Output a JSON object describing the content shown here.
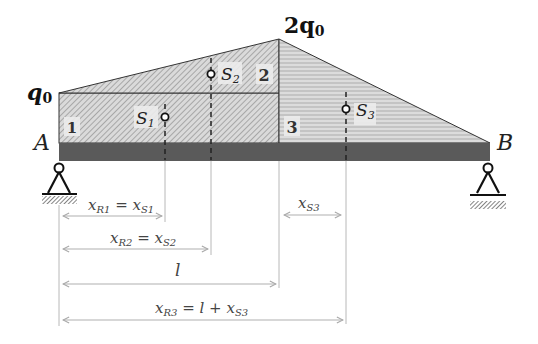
{
  "diagram": {
    "type": "beam-load-diagram",
    "colors": {
      "beam": "#5a5a5a",
      "region_hatch_bg": "#d8d8d8",
      "region_hatch_line": "#8a8a8a",
      "region3_bg": "#c8c8c8",
      "region3_line": "#efefef",
      "outline": "#333333",
      "dim_line": "#b0b0b0",
      "text": "#222222"
    },
    "load_labels": {
      "left": "q",
      "left_sub": "0",
      "peak_coef": "2q",
      "peak_sub": "0"
    },
    "supports": {
      "left": {
        "label": "A",
        "type": "pinned"
      },
      "right": {
        "label": "B",
        "type": "pinned"
      }
    },
    "regions": [
      {
        "number": "1",
        "shape": "rectangle",
        "pattern": "diagonal-hatch"
      },
      {
        "number": "2",
        "shape": "triangle",
        "pattern": "diagonal-hatch"
      },
      {
        "number": "3",
        "shape": "triangle",
        "pattern": "horizontal-lines"
      }
    ],
    "centroids": [
      {
        "label": "S",
        "sub": "1"
      },
      {
        "label": "S",
        "sub": "2"
      },
      {
        "label": "S",
        "sub": "3"
      }
    ],
    "dimensions": [
      {
        "lhs": "x",
        "lhs_sub": "R1",
        "eq": " = ",
        "rhs": "x",
        "rhs_sub": "S1"
      },
      {
        "lhs": "x",
        "lhs_sub": "R2",
        "eq": " = ",
        "rhs": "x",
        "rhs_sub": "S2"
      },
      {
        "lhs": "l"
      },
      {
        "lhs": "x",
        "lhs_sub": "R3",
        "eq": " = ",
        "mid": "l",
        "plus": " + ",
        "rhs": "x",
        "rhs_sub": "S3"
      },
      {
        "lhs": "x",
        "lhs_sub": "S3"
      }
    ]
  }
}
